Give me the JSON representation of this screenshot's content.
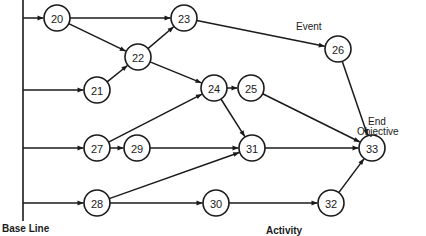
{
  "labels": {
    "event": "Event",
    "end_objective_line1": "End",
    "end_objective_line2": "Objective",
    "base_line": "Base Line",
    "activity": "Activity"
  },
  "colors": {
    "stroke": "#1a1a1a",
    "background": "#ffffff"
  },
  "baseline": {
    "x": 23,
    "y1": 0,
    "y2": 221
  },
  "node_radius": 13,
  "nodes": [
    {
      "id": "20",
      "label": "20",
      "x": 57,
      "y": 18
    },
    {
      "id": "21",
      "label": "21",
      "x": 97,
      "y": 90
    },
    {
      "id": "22",
      "label": "22",
      "x": 138,
      "y": 57
    },
    {
      "id": "23",
      "label": "23",
      "x": 184,
      "y": 18
    },
    {
      "id": "24",
      "label": "24",
      "x": 214,
      "y": 88
    },
    {
      "id": "25",
      "label": "25",
      "x": 251,
      "y": 88
    },
    {
      "id": "26",
      "label": "26",
      "x": 338,
      "y": 49
    },
    {
      "id": "27",
      "label": "27",
      "x": 97,
      "y": 148
    },
    {
      "id": "28",
      "label": "28",
      "x": 97,
      "y": 203
    },
    {
      "id": "29",
      "label": "29",
      "x": 137,
      "y": 148
    },
    {
      "id": "30",
      "label": "30",
      "x": 216,
      "y": 203
    },
    {
      "id": "31",
      "label": "31",
      "x": 252,
      "y": 148
    },
    {
      "id": "32",
      "label": "32",
      "x": 331,
      "y": 203
    },
    {
      "id": "33",
      "label": "33",
      "x": 372,
      "y": 148
    }
  ],
  "baseline_edges": [
    {
      "to": "20",
      "y": 18
    },
    {
      "to": "21",
      "y": 90
    },
    {
      "to": "27",
      "y": 148
    },
    {
      "to": "28",
      "y": 203
    }
  ],
  "edges": [
    {
      "from": "20",
      "to": "23"
    },
    {
      "from": "20",
      "to": "22"
    },
    {
      "from": "22",
      "to": "23"
    },
    {
      "from": "21",
      "to": "22"
    },
    {
      "from": "22",
      "to": "24"
    },
    {
      "from": "23",
      "to": "26"
    },
    {
      "from": "27",
      "to": "24"
    },
    {
      "from": "27",
      "to": "29"
    },
    {
      "from": "24",
      "to": "25"
    },
    {
      "from": "24",
      "to": "31"
    },
    {
      "from": "29",
      "to": "31"
    },
    {
      "from": "28",
      "to": "31"
    },
    {
      "from": "28",
      "to": "30"
    },
    {
      "from": "25",
      "to": "33"
    },
    {
      "from": "26",
      "to": "33"
    },
    {
      "from": "31",
      "to": "33"
    },
    {
      "from": "30",
      "to": "32"
    },
    {
      "from": "32",
      "to": "33"
    }
  ]
}
